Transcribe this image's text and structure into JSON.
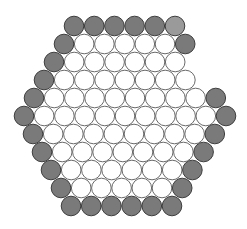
{
  "diagram": {
    "type": "hexagonal-circle-packing",
    "canvas": {
      "width": 247,
      "height": 229,
      "background": "#ffffff"
    },
    "circle_radius": 9.8,
    "spacing_x": 20.2,
    "colors": {
      "gray_fill": "#7a7a7a",
      "gray_light_fill": "#9a9a9a",
      "gray_stroke": "#3e3e3e",
      "white_fill": "#ffffff",
      "white_stroke": "#6a6a6a"
    },
    "rows": [
      {
        "y": 26,
        "x0": 74,
        "cells": [
          "g",
          "g",
          "g",
          "g",
          "g",
          "l"
        ]
      },
      {
        "y": 44,
        "x0": 64,
        "cells": [
          "g",
          "w",
          "w",
          "w",
          "w",
          "w",
          "g"
        ]
      },
      {
        "y": 62,
        "x0": 54,
        "cells": [
          "g",
          "w",
          "w",
          "w",
          "w",
          "w",
          "w"
        ]
      },
      {
        "y": 80,
        "x0": 44,
        "cells": [
          "g",
          "w",
          "w",
          "w",
          "w",
          "w",
          "w",
          "w"
        ]
      },
      {
        "y": 98,
        "x0": 34,
        "cells": [
          "g",
          "w",
          "w",
          "w",
          "w",
          "w",
          "w",
          "w",
          "w",
          "g"
        ]
      },
      {
        "y": 116,
        "x0": 24,
        "cells": [
          "g",
          "w",
          "w",
          "w",
          "w",
          "w",
          "w",
          "w",
          "w",
          "w",
          "g"
        ]
      },
      {
        "y": 134,
        "x0": 33,
        "cells": [
          "g",
          "w",
          "w",
          "w",
          "w",
          "w",
          "w",
          "w",
          "w",
          "g"
        ]
      },
      {
        "y": 152,
        "x0": 42,
        "cells": [
          "g",
          "w",
          "w",
          "w",
          "w",
          "w",
          "w",
          "w",
          "g"
        ]
      },
      {
        "y": 170,
        "x0": 51,
        "cells": [
          "g",
          "w",
          "w",
          "w",
          "w",
          "w",
          "w",
          "g"
        ]
      },
      {
        "y": 188,
        "x0": 61,
        "cells": [
          "g",
          "w",
          "w",
          "w",
          "w",
          "w",
          "g"
        ]
      },
      {
        "y": 206,
        "x0": 71,
        "cells": [
          "g",
          "g",
          "g",
          "g",
          "g",
          "g"
        ]
      }
    ],
    "legend_keys": {
      "g": "boundary-circle",
      "l": "boundary-circle-light",
      "w": "interior-circle"
    }
  }
}
